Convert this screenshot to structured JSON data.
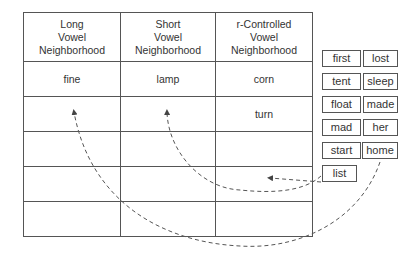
{
  "table": {
    "headers": [
      "Long\nVowel\nNeighborhood",
      "Short\nVowel\nNeighborhood",
      "r-Controlled\nVowel\nNeighborhood"
    ],
    "header_lines": [
      [
        "Long",
        "Vowel",
        "Neighborhood"
      ],
      [
        "Short",
        "Vowel",
        "Neighborhood"
      ],
      [
        "r-Controlled",
        "Vowel",
        "Neighborhood"
      ]
    ],
    "rows": [
      [
        "fine",
        "lamp",
        "corn"
      ],
      [
        "",
        "",
        "turn"
      ],
      [
        "",
        "",
        ""
      ],
      [
        "",
        "",
        ""
      ],
      [
        "",
        "",
        ""
      ]
    ]
  },
  "word_cards": [
    {
      "word": "first"
    },
    {
      "word": "lost"
    },
    {
      "word": "tent"
    },
    {
      "word": "sleep"
    },
    {
      "word": "float"
    },
    {
      "word": "made"
    },
    {
      "word": "mad"
    },
    {
      "word": "her"
    },
    {
      "word": "start"
    },
    {
      "word": "home"
    },
    {
      "word": "list"
    }
  ],
  "arrows": [
    {
      "from": "start",
      "to": "r-Controlled Vowel Neighborhood"
    },
    {
      "from": "list",
      "to": "Short Vowel Neighborhood"
    },
    {
      "from": "home",
      "to": "Long Vowel Neighborhood"
    }
  ]
}
